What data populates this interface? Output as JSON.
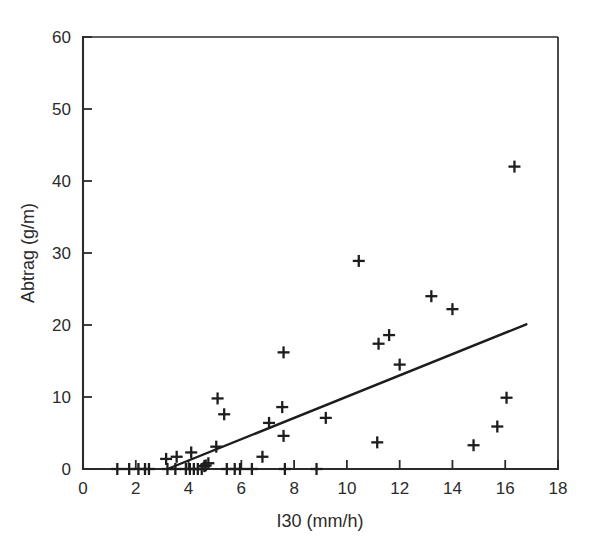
{
  "chart_data": {
    "type": "scatter",
    "title": "",
    "xlabel": "I30 (mm/h)",
    "ylabel": "Abtrag (g/m)",
    "xlim": [
      0,
      18
    ],
    "ylim": [
      0,
      60
    ],
    "xticks": [
      0,
      2,
      4,
      6,
      8,
      10,
      12,
      14,
      16,
      18
    ],
    "yticks": [
      0,
      10,
      20,
      30,
      40,
      50,
      60
    ],
    "xtick_labels": [
      "0",
      "2",
      "4",
      "6",
      "8",
      "10",
      "12",
      "14",
      "16",
      "18"
    ],
    "ytick_labels": [
      "0",
      "10",
      "20",
      "30",
      "40",
      "50",
      "60"
    ],
    "grid": false,
    "legend": false,
    "marker": "plus",
    "marker_color": "#1d1d1d",
    "series": [
      {
        "name": "Abtrag vs I30",
        "points": [
          [
            1.3,
            0
          ],
          [
            1.75,
            0
          ],
          [
            2.1,
            0
          ],
          [
            2.35,
            0
          ],
          [
            2.5,
            0
          ],
          [
            3.15,
            1.4
          ],
          [
            3.2,
            0
          ],
          [
            3.5,
            0
          ],
          [
            3.55,
            1.7
          ],
          [
            3.9,
            0
          ],
          [
            4.05,
            0
          ],
          [
            4.1,
            2.3
          ],
          [
            4.2,
            0
          ],
          [
            4.35,
            0
          ],
          [
            4.5,
            0
          ],
          [
            4.6,
            0.4
          ],
          [
            4.65,
            0.5
          ],
          [
            4.75,
            0.8
          ],
          [
            5.05,
            3.1
          ],
          [
            5.1,
            9.8
          ],
          [
            5.35,
            7.6
          ],
          [
            5.45,
            0
          ],
          [
            5.75,
            0
          ],
          [
            5.95,
            0
          ],
          [
            6.4,
            0
          ],
          [
            6.8,
            1.7
          ],
          [
            7.05,
            6.4
          ],
          [
            7.55,
            8.6
          ],
          [
            7.6,
            16.2
          ],
          [
            7.6,
            4.6
          ],
          [
            7.65,
            0
          ],
          [
            8.85,
            0
          ],
          [
            9.2,
            7.1
          ],
          [
            10.45,
            28.9
          ],
          [
            11.15,
            3.7
          ],
          [
            11.2,
            17.4
          ],
          [
            11.6,
            18.6
          ],
          [
            12.0,
            14.5
          ],
          [
            13.2,
            24.0
          ],
          [
            14.0,
            22.2
          ],
          [
            14.8,
            3.3
          ],
          [
            15.7,
            5.9
          ],
          [
            16.05,
            9.9
          ],
          [
            16.35,
            42.0
          ]
        ]
      }
    ],
    "fit_line": {
      "name": "regression-line",
      "x_start": 3.2,
      "y_start": 0,
      "x_end": 16.8,
      "y_end": 20.1,
      "color": "#1d1d1d"
    }
  },
  "axes": {
    "x_axis_name": "x-axis",
    "y_axis_name": "y-axis"
  }
}
